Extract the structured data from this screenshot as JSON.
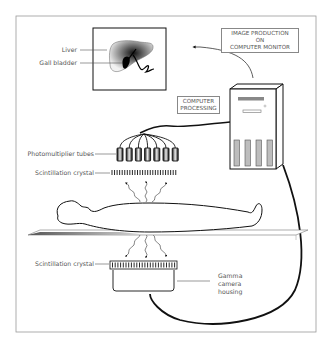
{
  "diagram": {
    "labels": {
      "liver": "Liver",
      "gall_bladder": "Gall bladder",
      "image_production_line1": "IMAGE PRODUCTION",
      "image_production_line2": "ON",
      "image_production_line3": "COMPUTER MONITOR",
      "computer_processing_line1": "COMPUTER",
      "computer_processing_line2": "PROCESSING",
      "photomultiplier_tubes": "Photomultiplier tubes",
      "scintillation_crystal_top": "Scintillation crystal",
      "scintillation_crystal_bottom": "Scintillation crystal",
      "gamma_camera_line1": "Gamma",
      "gamma_camera_line2": "camera",
      "gamma_camera_line3": "housing"
    },
    "components": {
      "photomultiplier_tube_count": 7,
      "computer_drive_bays": 4
    },
    "colors": {
      "line": "#111111",
      "frame": "#999999",
      "label_text": "#555555",
      "drive_bay_fill": "#bdbdbd",
      "table_shadow": "#777777"
    }
  }
}
